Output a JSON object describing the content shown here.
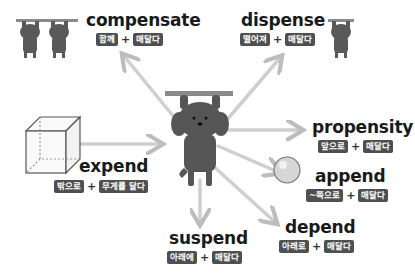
{
  "colors": {
    "background": "#ffffff",
    "badge_bg": "#4f4f4f",
    "badge_text": "#ffffff",
    "word_text": "#1a1a1a",
    "arrow": "#c8c8c8",
    "figure": "#555555"
  },
  "center": {
    "icon": "hanging-dog-icon"
  },
  "words": {
    "compensate": {
      "word": "compensate",
      "prefix": "함께",
      "root": "매달다",
      "plus": "+",
      "icon": "two-hanging-dogs-icon"
    },
    "dispense": {
      "word": "dispense",
      "prefix": "떨어져",
      "root": "매달다",
      "plus": "+",
      "icon": "hanging-dog-icon"
    },
    "expend": {
      "word": "expend",
      "prefix": "밖으로",
      "root": "무게를 달다",
      "plus": "+",
      "icon": "cube-icon"
    },
    "propensity": {
      "word": "propensity",
      "prefix": "앞으로",
      "root": "매달다",
      "plus": "+"
    },
    "append": {
      "word": "append",
      "prefix": "~쪽으로",
      "root": "매달다",
      "plus": "+",
      "icon": "sphere-icon"
    },
    "suspend": {
      "word": "suspend",
      "prefix": "아래에",
      "root": "매달다",
      "plus": "+"
    },
    "depend": {
      "word": "depend",
      "prefix": "아래로",
      "root": "매달다",
      "plus": "+"
    }
  }
}
